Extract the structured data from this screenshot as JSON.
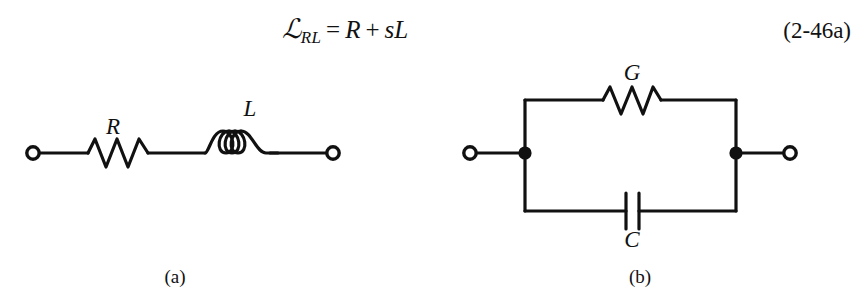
{
  "figure": {
    "background_color": "#ffffff",
    "ink_color": "#111111"
  },
  "equation": {
    "lhs_symbol": "ℒ",
    "lhs_subscript": "RL",
    "equals": "=",
    "term_1": "R",
    "plus": "+",
    "term_2_coef": "s",
    "term_2_var": "L",
    "full_text": "ℒRL = R + sL",
    "number": "(2-46a)"
  },
  "circuit_a": {
    "caption": "(a)",
    "topology": "series",
    "components": [
      {
        "symbol": "R",
        "type": "resistor",
        "label_x": 113,
        "label_y": 128
      },
      {
        "symbol": "L",
        "type": "inductor",
        "label_x": 250,
        "label_y": 128
      }
    ],
    "terminals": [
      {
        "name": "left-terminal",
        "style": "open-circle",
        "x": 33,
        "y": 153
      },
      {
        "name": "right-terminal",
        "style": "open-circle",
        "x": 333,
        "y": 153
      }
    ],
    "resistor_peaks": 3,
    "inductor_coils": 3
  },
  "circuit_b": {
    "caption": "(b)",
    "topology": "parallel",
    "components": [
      {
        "symbol": "G",
        "type": "resistor",
        "branch": "top",
        "label_x": 635,
        "label_y": 80
      },
      {
        "symbol": "C",
        "type": "capacitor",
        "branch": "bottom",
        "label_x": 635,
        "label_y": 238
      }
    ],
    "terminals": [
      {
        "name": "left-terminal",
        "style": "open-circle",
        "x": 470,
        "y": 153
      },
      {
        "name": "right-terminal",
        "style": "open-circle",
        "x": 790,
        "y": 153
      }
    ],
    "junctions": [
      {
        "name": "left-junction",
        "style": "filled-dot",
        "x": 525,
        "y": 153
      },
      {
        "name": "right-junction",
        "style": "filled-dot",
        "x": 736,
        "y": 153
      }
    ],
    "resistor_peaks": 3,
    "capacitor_plates": 2
  }
}
